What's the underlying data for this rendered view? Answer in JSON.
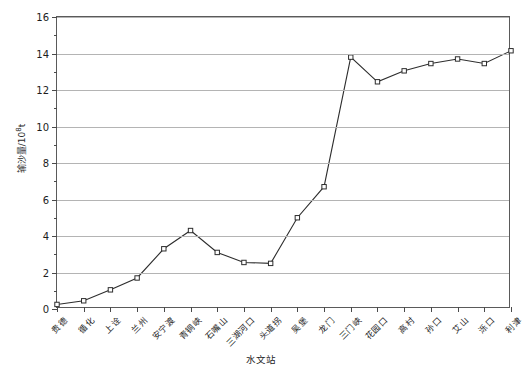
{
  "chart_data": {
    "type": "line",
    "title": "",
    "xlabel": "水文站",
    "ylabel": "输沙量/10⁸t",
    "ylabel_main": "输沙量/10",
    "ylabel_sup": "8",
    "ylabel_unit": "t",
    "ylim": [
      0,
      16
    ],
    "ytick_step": 2,
    "yticks": [
      0,
      2,
      4,
      6,
      8,
      10,
      12,
      14,
      16
    ],
    "ytick_labels": [
      "0",
      "2",
      "4",
      "6",
      "8",
      "10",
      "12",
      "14",
      "16"
    ],
    "yminor_ticks": [
      1,
      3,
      5,
      7,
      9,
      11,
      13,
      15
    ],
    "grid": "horizontal",
    "legend": "none",
    "marker": "open-square",
    "line_color": "#2d2d2d",
    "grid_color": "#b4b4b4",
    "axis_color": "#5a5a5a",
    "categories": [
      "贵德",
      "循化",
      "上诠",
      "兰州",
      "安宁渡",
      "青铜峡",
      "石嘴山",
      "三湖河口",
      "头道拐",
      "吴堡",
      "龙门",
      "三门峡",
      "花园口",
      "高村",
      "孙口",
      "艾山",
      "泺口",
      "利津"
    ],
    "values": [
      0.25,
      0.45,
      1.05,
      1.7,
      3.3,
      4.3,
      3.1,
      2.55,
      2.5,
      5.0,
      6.7,
      13.8,
      12.45,
      13.05,
      13.45,
      13.7,
      13.45,
      14.15
    ]
  }
}
